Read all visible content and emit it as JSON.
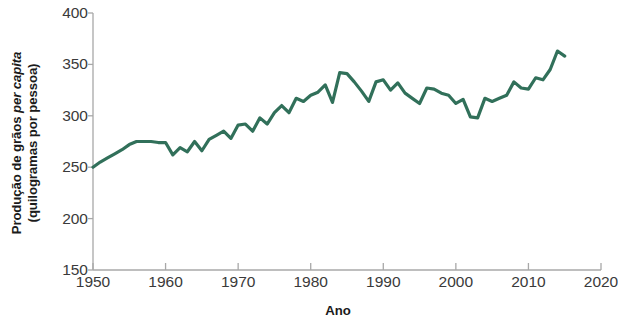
{
  "chart_data": {
    "type": "line",
    "title": "",
    "xlabel": "Ano",
    "ylabel_line1": "Produção de grãos per capita",
    "ylabel_line1_plain": "Produção de grãos ",
    "ylabel_line1_italic": "per capita",
    "ylabel_line2": "(quilogramas por pessoa)",
    "xlim": [
      1950,
      2020
    ],
    "ylim": [
      150,
      400
    ],
    "xticks": [
      1950,
      1960,
      1970,
      1980,
      1990,
      2000,
      2010,
      2020
    ],
    "xtick_labels": [
      "1950",
      "1960",
      "1970",
      "1980",
      "1990",
      "2000",
      "2010",
      "2020"
    ],
    "yticks": [
      150,
      200,
      250,
      300,
      350,
      400
    ],
    "ytick_labels": [
      "150",
      "200",
      "250",
      "300",
      "350",
      "400"
    ],
    "grid": false,
    "legend": "none",
    "line_color": "#31705A",
    "line_width": 3.2,
    "axis_color": "#a8a8a8",
    "series": [
      {
        "name": "Produção de grãos per capita",
        "x": [
          1950,
          1951,
          1952,
          1953,
          1954,
          1955,
          1956,
          1957,
          1958,
          1959,
          1960,
          1961,
          1962,
          1963,
          1964,
          1965,
          1966,
          1967,
          1968,
          1969,
          1970,
          1971,
          1972,
          1973,
          1974,
          1975,
          1976,
          1977,
          1978,
          1979,
          1980,
          1981,
          1982,
          1983,
          1984,
          1985,
          1986,
          1987,
          1988,
          1989,
          1990,
          1991,
          1992,
          1993,
          1994,
          1995,
          1996,
          1997,
          1998,
          1999,
          2000,
          2001,
          2002,
          2003,
          2004,
          2005,
          2006,
          2007,
          2008,
          2009,
          2010,
          2011,
          2012,
          2013,
          2014,
          2015
        ],
        "values": [
          250,
          255,
          259,
          263,
          267,
          272,
          275,
          275,
          275,
          274,
          274,
          262,
          269,
          265,
          275,
          266,
          277,
          281,
          285,
          278,
          291,
          292,
          285,
          298,
          292,
          303,
          310,
          303,
          317,
          314,
          320,
          323,
          330,
          313,
          342,
          341,
          333,
          324,
          314,
          333,
          335,
          325,
          332,
          322,
          317,
          312,
          327,
          326,
          322,
          320,
          312,
          316,
          299,
          298,
          317,
          314,
          317,
          320,
          333,
          327,
          326,
          337,
          335,
          345,
          363,
          358
        ]
      }
    ]
  }
}
